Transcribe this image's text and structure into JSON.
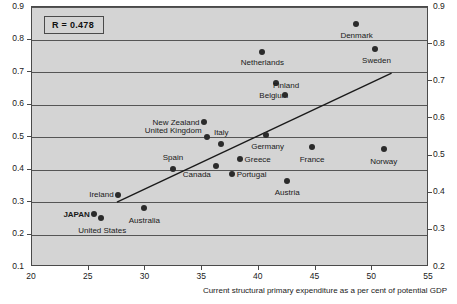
{
  "chart_data": {
    "type": "scatter",
    "title": "",
    "subtitle": "",
    "annotation": "R  = 0.478",
    "xlabel": "Current structural primary expenditure as a per cent of potential GDP",
    "ylabel": "",
    "xlim": [
      20,
      55
    ],
    "ylim_left": [
      0.1,
      0.9
    ],
    "ylim_right": [
      0.2,
      0.9
    ],
    "grid": true,
    "legend": "none",
    "xticks": [
      20,
      25,
      30,
      35,
      40,
      45,
      50,
      55
    ],
    "xtick_labels": [
      "20",
      "25",
      "30",
      "35",
      "40",
      "45",
      "50",
      "55"
    ],
    "yticks_left": [
      0.1,
      0.2,
      0.3,
      0.4,
      0.5,
      0.6,
      0.7,
      0.8,
      0.9
    ],
    "ytick_labels_left": [
      "0.1",
      "0.2",
      "0.3",
      "0.4",
      "0.5",
      "0.6",
      "0.7",
      "0.8",
      "0.9"
    ],
    "yticks_right": [
      0.2,
      0.3,
      0.4,
      0.5,
      0.6,
      0.7,
      0.8,
      0.9
    ],
    "ytick_labels_right": [
      "0.2",
      "0.3",
      "0.4",
      "0.5",
      "0.6",
      "0.7",
      "0.8",
      "0.9"
    ],
    "trendline": {
      "x0": 27.5,
      "y0": 0.295,
      "x1": 51.9,
      "y1": 0.695
    },
    "points": [
      {
        "label": "JAPAN",
        "x": 25.5,
        "y": 0.262,
        "lx": -4,
        "ly": 0,
        "anchor": "right",
        "bold": true
      },
      {
        "label": "United States",
        "x": 26.1,
        "y": 0.252,
        "lx": 1,
        "ly": 13,
        "anchor": "center",
        "bold": false
      },
      {
        "label": "Ireland",
        "x": 27.6,
        "y": 0.322,
        "lx": -5,
        "ly": 0,
        "anchor": "right",
        "bold": false
      },
      {
        "label": "Australia",
        "x": 29.9,
        "y": 0.281,
        "lx": 0,
        "ly": 12,
        "anchor": "center",
        "bold": false
      },
      {
        "label": "Spain",
        "x": 32.4,
        "y": 0.402,
        "lx": 0,
        "ly": -11,
        "anchor": "center",
        "bold": false
      },
      {
        "label": "New Zealand",
        "x": 35.2,
        "y": 0.545,
        "lx": -5,
        "ly": 0,
        "anchor": "right",
        "bold": false
      },
      {
        "label": "United Kingdom",
        "x": 35.4,
        "y": 0.501,
        "lx": -5,
        "ly": -6,
        "anchor": "right",
        "bold": false
      },
      {
        "label": "Canada",
        "x": 36.2,
        "y": 0.41,
        "lx": -5,
        "ly": 8,
        "anchor": "right",
        "bold": false
      },
      {
        "label": "Italy",
        "x": 36.7,
        "y": 0.48,
        "lx": 0,
        "ly": -11,
        "anchor": "center",
        "bold": false
      },
      {
        "label": "Portugal",
        "x": 37.6,
        "y": 0.385,
        "lx": 5,
        "ly": 0,
        "anchor": "left",
        "bold": false
      },
      {
        "label": "Greece",
        "x": 38.3,
        "y": 0.432,
        "lx": 5,
        "ly": 0,
        "anchor": "left",
        "bold": false
      },
      {
        "label": "Netherlands",
        "x": 40.3,
        "y": 0.762,
        "lx": 0,
        "ly": 11,
        "anchor": "center",
        "bold": false
      },
      {
        "label": "Germany",
        "x": 40.6,
        "y": 0.506,
        "lx": 2,
        "ly": 11,
        "anchor": "center",
        "bold": false
      },
      {
        "label": "Belgium",
        "x": 41.5,
        "y": 0.665,
        "lx": -2,
        "ly": 12,
        "anchor": "center",
        "bold": false
      },
      {
        "label": "Finland",
        "x": 42.3,
        "y": 0.628,
        "lx": 1,
        "ly": -10,
        "anchor": "center",
        "bold": false
      },
      {
        "label": "Austria",
        "x": 42.5,
        "y": 0.365,
        "lx": 0,
        "ly": 12,
        "anchor": "center",
        "bold": false
      },
      {
        "label": "France",
        "x": 44.7,
        "y": 0.468,
        "lx": 0,
        "ly": 12,
        "anchor": "center",
        "bold": false
      },
      {
        "label": "Denmark",
        "x": 48.6,
        "y": 0.848,
        "lx": 0,
        "ly": 12,
        "anchor": "center",
        "bold": false
      },
      {
        "label": "Sweden",
        "x": 50.2,
        "y": 0.772,
        "lx": 2,
        "ly": 12,
        "anchor": "center",
        "bold": false
      },
      {
        "label": "Norway",
        "x": 51.0,
        "y": 0.462,
        "lx": 0,
        "ly": 12,
        "anchor": "center",
        "bold": false
      }
    ]
  },
  "colors": {
    "plot_background": "#d4d4d4",
    "grid": "#555555",
    "marker": "#2b2b2b",
    "trendline": "#1a1a1a",
    "axis": "#4a4a4a",
    "text": "#1a1a1a"
  }
}
